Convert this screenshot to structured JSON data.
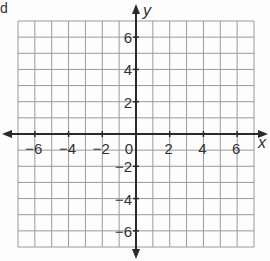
{
  "corner_text": "d",
  "graph": {
    "x_axis_label": "x",
    "y_axis_label": "y",
    "x_range": [
      -7,
      7
    ],
    "y_range": [
      -7,
      7
    ],
    "grid_step": 1,
    "x_tick_labels": [
      "-6",
      "-4",
      "-2",
      "2",
      "4",
      "6"
    ],
    "y_tick_labels": [
      "6",
      "4",
      "2",
      "-2",
      "-4",
      "-6"
    ],
    "origin_label": "0",
    "colors": {
      "grid": "#9a9a9a",
      "axis": "#2a2a2a",
      "text": "#333333"
    }
  }
}
